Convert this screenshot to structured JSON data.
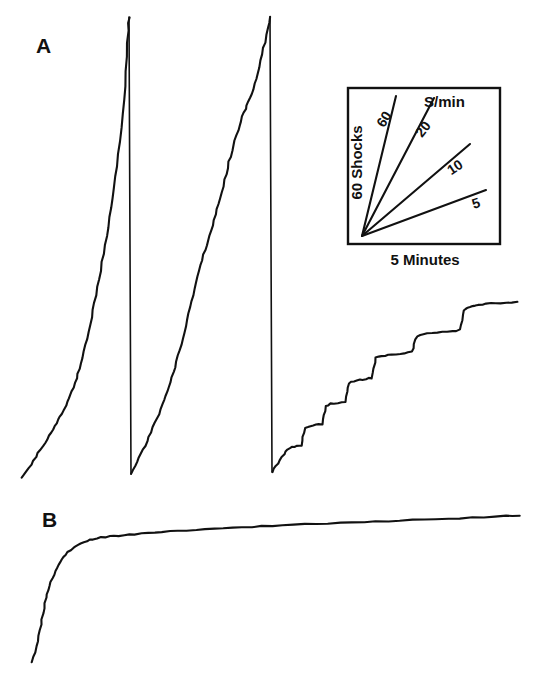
{
  "figure": {
    "kind": "cumulative-record",
    "width": 536,
    "height": 697,
    "background": "#ffffff",
    "ink_color": "#111111"
  },
  "panels": [
    {
      "id": "A",
      "label": "A",
      "description": "cumulative shock record with three pen resets, high steady responding then stepped pausing"
    },
    {
      "id": "B",
      "label": "B",
      "description": "cumulative shock record, negatively accelerated, rapid early responding then near-zero rate"
    }
  ],
  "inset": {
    "title": "S/min",
    "ylabel": "60 Shocks",
    "xlabel": "5 Minutes",
    "rate_labels": [
      "60",
      "20",
      "10",
      "5"
    ],
    "box": {
      "x": 348,
      "y": 88,
      "width": 152,
      "height": 156
    }
  },
  "chart_data": {
    "type": "line",
    "title": "",
    "xlabel": "5 Minutes",
    "ylabel": "60 Shocks",
    "grid": false,
    "legend": "inset rate key",
    "legend_position": "upper-right inset",
    "units": {
      "x": "minutes",
      "y": "cumulative shocks"
    },
    "inset_key": {
      "type": "line",
      "title": "S/min",
      "xlabel": "5 Minutes",
      "ylabel": "60 Shocks",
      "box_px": {
        "x": 348,
        "y": 88,
        "w": 152,
        "h": 156
      },
      "origin_px": [
        362,
        236
      ],
      "series": [
        {
          "name": "60",
          "slope_label": "60",
          "end_px": [
            396,
            96
          ]
        },
        {
          "name": "20",
          "slope_label": "20",
          "end_px": [
            434,
            98
          ]
        },
        {
          "name": "10",
          "slope_label": "10",
          "end_px": [
            470,
            144
          ]
        },
        {
          "name": "5",
          "slope_label": "5",
          "end_px": [
            486,
            190
          ]
        }
      ]
    },
    "series": [
      {
        "name": "A-segment-1",
        "panel": "A",
        "resets_after": true,
        "points_px": [
          [
            22,
            478
          ],
          [
            26,
            472
          ],
          [
            31,
            464
          ],
          [
            36,
            457
          ],
          [
            40,
            450
          ],
          [
            45,
            443
          ],
          [
            49,
            436
          ],
          [
            53,
            430
          ],
          [
            57,
            423
          ],
          [
            60,
            417
          ],
          [
            63,
            411
          ],
          [
            66,
            405
          ],
          [
            69,
            398
          ],
          [
            72,
            391
          ],
          [
            75,
            383
          ],
          [
            78,
            374
          ],
          [
            81,
            364
          ],
          [
            84,
            352
          ],
          [
            87,
            339
          ],
          [
            90,
            325
          ],
          [
            93,
            310
          ],
          [
            96,
            295
          ],
          [
            99,
            279
          ],
          [
            102,
            262
          ],
          [
            105,
            245
          ],
          [
            108,
            227
          ],
          [
            111,
            208
          ],
          [
            114,
            188
          ],
          [
            117,
            166
          ],
          [
            120,
            142
          ],
          [
            123,
            114
          ],
          [
            125,
            86
          ],
          [
            127,
            56
          ],
          [
            128,
            30
          ],
          [
            129,
            17
          ]
        ]
      },
      {
        "name": "A-segment-2",
        "panel": "A",
        "resets_after": true,
        "points_px": [
          [
            131,
            474
          ],
          [
            135,
            466
          ],
          [
            139,
            458
          ],
          [
            143,
            450
          ],
          [
            147,
            441
          ],
          [
            151,
            432
          ],
          [
            155,
            423
          ],
          [
            159,
            414
          ],
          [
            163,
            404
          ],
          [
            166,
            396
          ],
          [
            169,
            387
          ],
          [
            172,
            377
          ],
          [
            175,
            367
          ],
          [
            178,
            356
          ],
          [
            181,
            345
          ],
          [
            184,
            333
          ],
          [
            187,
            320
          ],
          [
            190,
            307
          ],
          [
            193,
            295
          ],
          [
            196,
            283
          ],
          [
            199,
            271
          ],
          [
            202,
            260
          ],
          [
            205,
            250
          ],
          [
            208,
            240
          ],
          [
            211,
            230
          ],
          [
            214,
            220
          ],
          [
            217,
            209
          ],
          [
            220,
            198
          ],
          [
            223,
            186
          ],
          [
            226,
            174
          ],
          [
            229,
            162
          ],
          [
            232,
            151
          ],
          [
            235,
            140
          ],
          [
            238,
            130
          ],
          [
            241,
            121
          ],
          [
            244,
            113
          ],
          [
            247,
            106
          ],
          [
            250,
            98
          ],
          [
            253,
            89
          ],
          [
            256,
            79
          ],
          [
            259,
            67
          ],
          [
            262,
            54
          ],
          [
            265,
            42
          ],
          [
            268,
            28
          ],
          [
            270,
            17
          ]
        ]
      },
      {
        "name": "A-segment-3",
        "panel": "A",
        "resets_after": false,
        "points_px": [
          [
            272,
            472
          ],
          [
            276,
            466
          ],
          [
            280,
            460
          ],
          [
            284,
            454
          ],
          [
            288,
            449
          ],
          [
            292,
            447
          ],
          [
            297,
            446
          ],
          [
            302,
            445
          ],
          [
            303,
            437
          ],
          [
            305,
            428
          ],
          [
            310,
            426
          ],
          [
            316,
            425
          ],
          [
            322,
            424
          ],
          [
            324,
            415
          ],
          [
            326,
            406
          ],
          [
            331,
            404
          ],
          [
            338,
            403
          ],
          [
            345,
            402
          ],
          [
            347,
            392
          ],
          [
            349,
            383
          ],
          [
            354,
            381
          ],
          [
            360,
            380
          ],
          [
            366,
            379
          ],
          [
            372,
            378
          ],
          [
            374,
            368
          ],
          [
            376,
            358
          ],
          [
            381,
            356
          ],
          [
            388,
            355
          ],
          [
            396,
            354
          ],
          [
            404,
            353
          ],
          [
            412,
            352
          ],
          [
            414,
            344
          ],
          [
            417,
            336
          ],
          [
            423,
            334
          ],
          [
            432,
            333
          ],
          [
            442,
            332
          ],
          [
            452,
            331
          ],
          [
            460,
            330
          ],
          [
            462,
            320
          ],
          [
            464,
            310
          ],
          [
            468,
            308
          ],
          [
            472,
            306
          ],
          [
            478,
            305
          ],
          [
            486,
            304
          ],
          [
            496,
            303
          ],
          [
            506,
            303
          ],
          [
            518,
            302
          ]
        ]
      },
      {
        "name": "B",
        "panel": "B",
        "resets_after": false,
        "points_px": [
          [
            32,
            662
          ],
          [
            35,
            652
          ],
          [
            38,
            641
          ],
          [
            40,
            630
          ],
          [
            42,
            619
          ],
          [
            44,
            608
          ],
          [
            46,
            598
          ],
          [
            48,
            590
          ],
          [
            51,
            582
          ],
          [
            54,
            575
          ],
          [
            57,
            568
          ],
          [
            60,
            562
          ],
          [
            64,
            557
          ],
          [
            68,
            552
          ],
          [
            73,
            548
          ],
          [
            78,
            545
          ],
          [
            84,
            542
          ],
          [
            90,
            540
          ],
          [
            97,
            538
          ],
          [
            105,
            537
          ],
          [
            114,
            536
          ],
          [
            124,
            535
          ],
          [
            135,
            534
          ],
          [
            148,
            533
          ],
          [
            162,
            532
          ],
          [
            178,
            531
          ],
          [
            196,
            530
          ],
          [
            214,
            529
          ],
          [
            232,
            528
          ],
          [
            252,
            527
          ],
          [
            272,
            526
          ],
          [
            294,
            525
          ],
          [
            316,
            524
          ],
          [
            340,
            523
          ],
          [
            364,
            522
          ],
          [
            388,
            521
          ],
          [
            412,
            520
          ],
          [
            436,
            519
          ],
          [
            460,
            518
          ],
          [
            484,
            517
          ],
          [
            506,
            516
          ],
          [
            520,
            516
          ]
        ]
      }
    ]
  }
}
